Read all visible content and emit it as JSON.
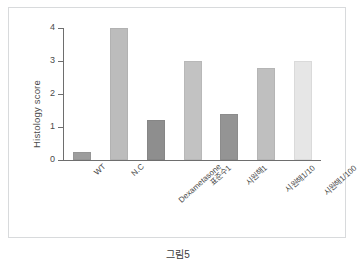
{
  "caption": "그림5",
  "chart_data": {
    "type": "bar",
    "title": "",
    "xlabel": "",
    "ylabel": "Histology score",
    "ylim": [
      0,
      4
    ],
    "yticks": [
      "0",
      "1",
      "2",
      "3",
      "4"
    ],
    "grid": false,
    "legend": "none",
    "categories": [
      "WT",
      "N.C",
      "Dexametasone",
      "표준수1",
      "시원해1",
      "시원해1/10",
      "시원해1/100"
    ],
    "values": [
      0.25,
      4.0,
      1.2,
      3.0,
      1.4,
      2.8,
      3.0
    ],
    "bar_colors": [
      "#9d9d9d",
      "#bcbcbc",
      "#8e8e8e",
      "#c2c2c2",
      "#949494",
      "#bfbfbf",
      "#e6e6e6"
    ]
  }
}
